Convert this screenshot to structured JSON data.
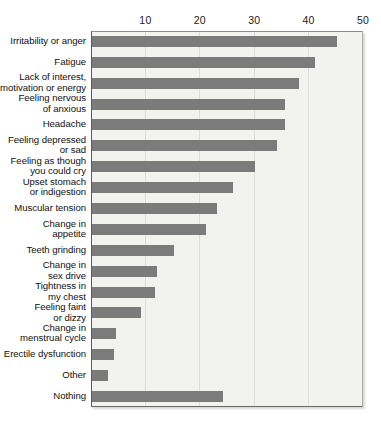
{
  "chart_data": {
    "type": "bar",
    "orientation": "horizontal",
    "title": "",
    "xlabel": "",
    "ylabel": "",
    "xlim": [
      0,
      50
    ],
    "xticks": [
      10,
      20,
      30,
      40,
      50
    ],
    "xtick_labels": [
      "10",
      "20",
      "30",
      "40",
      "50"
    ],
    "grid": true,
    "grid_axis": "x",
    "legend": "none",
    "bar_color": "#7b7b7b",
    "plot_background": "#f2f2f1",
    "categories": [
      "Irritability or anger",
      "Fatigue",
      "Lack of interest,\nmotivation or energy",
      "Feeling nervous\nof anxious",
      "Headache",
      "Feeling depressed\nor sad",
      "Feeling as though\nyou could cry",
      "Upset stomach\nor indigestion",
      "Muscular tension",
      "Change in\nappetite",
      "Teeth grinding",
      "Change in\nsex drive",
      "Tightness in\nmy chest",
      "Feeling faint\nor dizzy",
      "Change in\nmenstrual cycle",
      "Erectile dysfunction",
      "Other",
      "Nothing"
    ],
    "values": [
      45,
      41,
      38,
      35.5,
      35.5,
      34,
      30,
      26,
      23,
      21,
      15,
      12,
      11.5,
      9,
      4.5,
      4,
      3,
      24
    ]
  }
}
